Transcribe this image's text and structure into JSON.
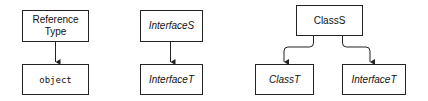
{
  "diagram": {
    "groups": [
      {
        "parent": {
          "lines": [
            "Reference",
            "Type"
          ],
          "style": "normal"
        },
        "children": [
          {
            "lines": [
              "object"
            ],
            "style": "mono"
          }
        ]
      },
      {
        "parent": {
          "lines": [
            "InterfaceS"
          ],
          "style": "italic"
        },
        "children": [
          {
            "lines": [
              "InterfaceT"
            ],
            "style": "italic"
          }
        ]
      },
      {
        "parent": {
          "lines": [
            "ClassS"
          ],
          "style": "normal"
        },
        "children": [
          {
            "lines": [
              "ClassT"
            ],
            "style": "italic"
          },
          {
            "lines": [
              "InterfaceT"
            ],
            "style": "italic"
          }
        ]
      }
    ],
    "edges": [
      {
        "from": "Reference Type",
        "to": "object"
      },
      {
        "from": "InterfaceS",
        "to": "InterfaceT"
      },
      {
        "from": "ClassS",
        "to": "ClassT"
      },
      {
        "from": "ClassS",
        "to": "InterfaceT"
      }
    ]
  }
}
